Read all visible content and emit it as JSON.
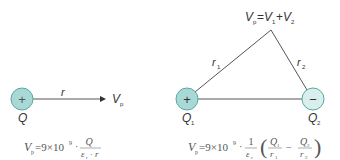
{
  "colors": {
    "positive_fill": "#a9d9d6",
    "negative_fill": "#d9efed",
    "charge_stroke": "#5aa7a3",
    "line": "#555555"
  },
  "left_diagram": {
    "charge_sign": "+",
    "charge_label": "Q",
    "distance_label": "r",
    "point_label": "V",
    "point_sub": "p",
    "formula": {
      "lhs": "V",
      "lhs_sub": "p",
      "prefix": "=9×10",
      "exp": "9",
      "dot": "·",
      "num": "Q",
      "den_eps": "ε",
      "den_eps_sub": "r",
      "den_dot": "·",
      "den_r": "r"
    }
  },
  "right_diagram": {
    "apex_label": {
      "v": "V",
      "p": "p",
      "eq": "=",
      "v1": "V",
      "s1": "1",
      "plus": "+",
      "v2": "V",
      "s2": "2"
    },
    "r1_label": "r",
    "r1_sub": "1",
    "r2_label": "r",
    "r2_sub": "2",
    "charge1": {
      "sign": "+",
      "label": "Q",
      "sub": "1"
    },
    "charge2": {
      "sign": "−",
      "label": "Q",
      "sub": "2"
    },
    "formula": {
      "lhs": "V",
      "lhs_sub": "p",
      "prefix": "=9×10",
      "exp": "9",
      "dot": "·",
      "one": "1",
      "eps": "ε",
      "eps_sub": "r",
      "q1": "Q",
      "q1_sub": "1",
      "r1": "r",
      "r1_sub": "1",
      "minus": "−",
      "q2": "Q",
      "q2_sub": "2",
      "r2": "r",
      "r2_sub": "2",
      "lparen": "(",
      "rparen": ")"
    }
  }
}
